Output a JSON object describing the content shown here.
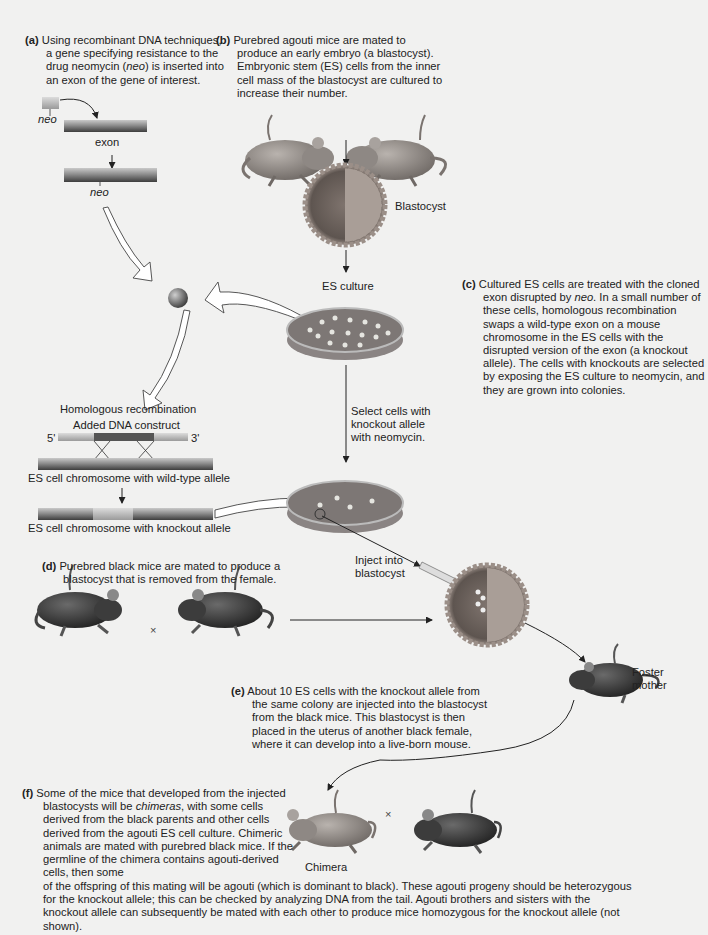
{
  "steps": {
    "a": {
      "label": "(a)",
      "text_1": "Using recombinant DNA techniques, a gene specifying resistance to the drug neomycin (",
      "text_italic": "neo",
      "text_2": ") is inserted into an exon of the gene of interest."
    },
    "b": {
      "label": "(b)",
      "text": "Purebred agouti mice are mated to produce an early embryo (a blastocyst). Embryonic stem (ES) cells from the inner cell mass of the blastocyst are cultured to increase their number."
    },
    "c": {
      "label": "(c)",
      "text_1": "Cultured ES cells are treated with the cloned exon disrupted by ",
      "text_italic": "neo",
      "text_2": ". In a small number of these cells, homologous recombination swaps a wild-type exon on a mouse chromosome in the ES cells with the disrupted version of the exon (a knockout allele). The cells with knockouts are selected by exposing the ES culture to neomycin, and they are grown into colonies."
    },
    "d": {
      "label": "(d)",
      "text": "Purebred black mice are mated to produce a blastocyst that is removed from the female."
    },
    "e": {
      "label": "(e)",
      "text": "About 10 ES cells with the knockout allele from the same colony are injected into the blastocyst from the black mice. This blastocyst is then placed in the uterus of another black female, where it can develop into a live-born mouse."
    },
    "f": {
      "label": "(f)",
      "text_1": "Some of the mice that developed from the injected blastocysts will be ",
      "text_italic": "chimeras",
      "text_2": ", with some cells derived from the black parents and other cells derived from the agouti ES cell culture. Chimeric animals are mated with purebred black mice. If the germline of the chimera contains agouti-derived cells, then some",
      "text_3": "of the offspring of this mating will be agouti (which is dominant to black). These agouti progeny should be heterozygous for the knockout allele; this can be checked by analyzing DNA from the tail. Agouti brothers and sisters with the knockout allele can subsequently be mated with each other to produce mice homozygous for the knockout allele (not shown)."
    }
  },
  "labels": {
    "neo_top": "neo",
    "exon_top": "exon",
    "exon_arrow": "exon",
    "neo_bottom": "neo",
    "blastocyst": "Blastocyst",
    "es_culture": "ES culture",
    "homologous_recombination": "Homologous recombination",
    "added_dna_construct": "Added DNA construct",
    "five_prime": "5'",
    "three_prime": "3'",
    "wild_type_chromosome": "ES cell chromosome with wild-type allele",
    "knockout_chromosome": "ES cell chromosome with knockout allele",
    "select_cells": "Select cells with knockout allele with neomycin.",
    "inject": "Inject into blastocyst",
    "foster_mother": "Foster mother",
    "chimera": "Chimera",
    "cross_symbol": "×"
  },
  "colors": {
    "background": "#f1f1f0",
    "agouti_mouse": "#8f8a86",
    "black_mouse": "#3a3a3a",
    "blastocyst_outer": "#9b8f88",
    "blastocyst_inner": "#6e6560",
    "petri_fluid": "#7d7775",
    "dna_bar": "#8a8a8a",
    "dna_dark": "#4a4a4a"
  }
}
